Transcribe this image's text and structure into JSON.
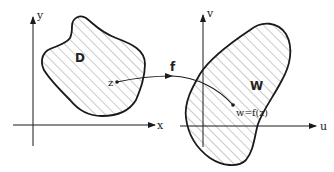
{
  "diagram": {
    "left_plane": {
      "x_axis_label": "x",
      "y_axis_label": "y",
      "region_label": "D",
      "point_label": "z"
    },
    "right_plane": {
      "x_axis_label": "u",
      "y_axis_label": "v",
      "region_label": "W",
      "point_label": "w=f(z)"
    },
    "mapping_label": "f",
    "colors": {
      "stroke": "#1a1a1a",
      "hatch": "#555555",
      "background": "#ffffff"
    }
  }
}
